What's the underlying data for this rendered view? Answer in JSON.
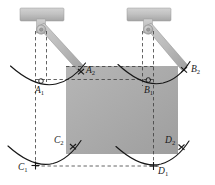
{
  "figure": {
    "type": "mechanical-linkage-schematic",
    "canvas": {
      "width": 215,
      "height": 185
    },
    "colors": {
      "background": "#ffffff",
      "plate_fill": "#a8a8a8",
      "plate_fill_light": "#b4b4b4",
      "bracket_fill": "#bdbdbd",
      "bracket_edge": "#8a8a8a",
      "arm_fill": "#b9b9b9",
      "line": "#1a1a1a",
      "dashed": "#4a4a4a",
      "label": "#1a1a1a"
    },
    "labels": [
      {
        "id": "A2",
        "base": "A",
        "sub": "2",
        "text": "A₂",
        "x": 86,
        "y": 71
      },
      {
        "id": "A1",
        "base": "A",
        "sub": "1",
        "text": "A₁",
        "x": 35,
        "y": 92
      },
      {
        "id": "B2",
        "base": "B",
        "sub": "2",
        "text": "B₂",
        "x": 190,
        "y": 70
      },
      {
        "id": "B1",
        "base": "B",
        "sub": "1",
        "text": "B₁",
        "x": 149,
        "y": 92
      },
      {
        "id": "C2",
        "base": "C",
        "sub": "2",
        "text": "C₂",
        "x": 58,
        "y": 140
      },
      {
        "id": "C1",
        "base": "C",
        "sub": "1",
        "text": "C₁",
        "x": 18,
        "y": 170
      },
      {
        "id": "D2",
        "base": "D",
        "sub": "2",
        "text": "D₂",
        "x": 167,
        "y": 140
      },
      {
        "id": "D1",
        "base": "D",
        "sub": "1",
        "text": "D₁",
        "x": 164,
        "y": 172
      }
    ],
    "plate": {
      "name": "suspended-plate",
      "x": 66,
      "y": 66,
      "width": 112,
      "height": 88
    },
    "brackets": [
      {
        "name": "left-bracket",
        "plate_x": 20,
        "plate_y": 8,
        "plate_w": 44,
        "plate_h": 13,
        "pivot_x": 41,
        "pivot_y": 30
      },
      {
        "name": "right-bracket",
        "plate_x": 127,
        "plate_y": 8,
        "plate_w": 44,
        "plate_h": 13,
        "pivot_x": 148,
        "pivot_y": 30
      }
    ],
    "marks": {
      "circle_mark": "small-circle-at-A1-B1",
      "cross_mark": "x-cross-at-A2-B2-C1-C2-D1-D2"
    }
  }
}
